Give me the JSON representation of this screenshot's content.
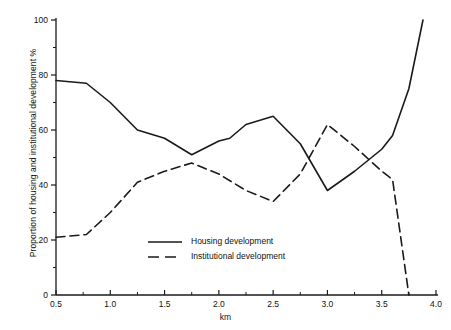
{
  "chart_data": {
    "type": "line",
    "title": "",
    "xlabel": "km",
    "ylabel": "Proportion of housing and institutional development %",
    "xlim": [
      0.5,
      4.0
    ],
    "ylim": [
      0,
      100
    ],
    "grid": false,
    "legend_position": "inside-lower-center",
    "x_ticks": [
      "0.5",
      "1.0",
      "1.5",
      "2.0",
      "2.5",
      "3.0",
      "3.5",
      "4.0"
    ],
    "x_tick_values": [
      0.5,
      1.0,
      1.5,
      2.0,
      2.5,
      3.0,
      3.5,
      4.0
    ],
    "x_minor_ticks": [
      0.75,
      1.25,
      1.75,
      2.25,
      2.75,
      3.25,
      3.75
    ],
    "y_ticks": [
      "0",
      "20",
      "40",
      "60",
      "80",
      "100"
    ],
    "y_tick_values": [
      0,
      20,
      40,
      60,
      80,
      100
    ],
    "y_minor_ticks": [
      10,
      30,
      50,
      70,
      90
    ],
    "series": [
      {
        "name": "Housing development",
        "style": "solid",
        "color": "#1a1a1a",
        "points": [
          [
            0.5,
            78
          ],
          [
            0.78,
            77
          ],
          [
            1.0,
            70
          ],
          [
            1.25,
            60
          ],
          [
            1.5,
            57
          ],
          [
            1.75,
            51
          ],
          [
            2.0,
            56
          ],
          [
            2.1,
            57
          ],
          [
            2.25,
            62
          ],
          [
            2.5,
            65
          ],
          [
            2.75,
            55
          ],
          [
            3.0,
            38
          ],
          [
            3.25,
            45
          ],
          [
            3.5,
            53
          ],
          [
            3.6,
            58
          ],
          [
            3.75,
            75
          ],
          [
            3.88,
            100
          ]
        ]
      },
      {
        "name": "Institutional development",
        "style": "dashed",
        "color": "#1a1a1a",
        "points": [
          [
            0.5,
            21
          ],
          [
            0.78,
            22
          ],
          [
            1.0,
            30
          ],
          [
            1.25,
            41
          ],
          [
            1.5,
            45
          ],
          [
            1.75,
            48
          ],
          [
            2.0,
            44
          ],
          [
            2.25,
            38
          ],
          [
            2.5,
            34
          ],
          [
            2.75,
            44
          ],
          [
            3.0,
            62
          ],
          [
            3.25,
            54
          ],
          [
            3.5,
            45
          ],
          [
            3.6,
            42
          ],
          [
            3.75,
            0
          ]
        ]
      }
    ]
  },
  "legend": {
    "items": [
      {
        "label": "Housing development",
        "style": "solid"
      },
      {
        "label": "Institutional development",
        "style": "dashed"
      }
    ]
  }
}
